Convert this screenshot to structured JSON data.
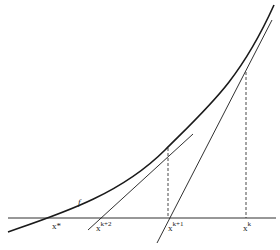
{
  "diagram": {
    "type": "newton-method-illustration",
    "curve_label": "f",
    "labels": {
      "x_star": "x*",
      "x_k2_base": "x",
      "x_k2_sup": "k+2",
      "x_k1_base": "x",
      "x_k1_sup": "k+1",
      "x_k_base": "x",
      "x_k_sup": "k"
    },
    "colors": {
      "line": "#1a1a1a",
      "background": "#ffffff"
    }
  }
}
